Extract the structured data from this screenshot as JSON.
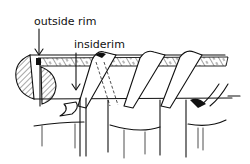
{
  "diagram": {
    "labels": {
      "outside_rim": "outside rim",
      "inside_rim": "insiderim"
    },
    "colors": {
      "ink": "#111111",
      "background": "#ffffff"
    }
  }
}
